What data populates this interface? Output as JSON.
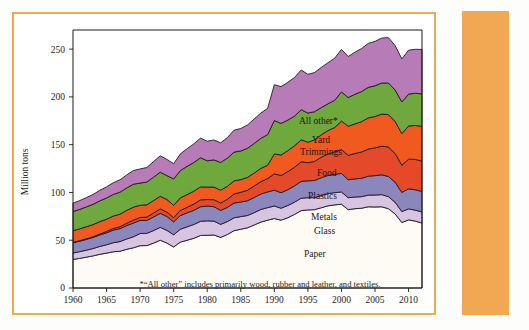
{
  "figure": {
    "frame_color": "#f0a94c",
    "side_bar_color": "#f2a852",
    "background_color": "#ffffff"
  },
  "footnote": {
    "text": "*“All other” includes primarily wood, rubber and leather, and textiles."
  },
  "series_labels": {
    "all_other": "All other*",
    "yard_trimmings_line1": "Yard",
    "yard_trimmings_line2": "Trimmings",
    "food": "Food",
    "plastics": "Plastics",
    "metals": "Metals",
    "glass": "Glass",
    "paper": "Paper"
  },
  "chart_data": {
    "type": "area",
    "title": "",
    "subtitle": "",
    "xlabel": "",
    "ylabel": "Million tons",
    "stacked": true,
    "grid": false,
    "legend_position": "inline-labels",
    "xlim": [
      1960,
      2012
    ],
    "ylim": [
      0,
      270
    ],
    "ytick_labels": [
      "0",
      "50",
      "100",
      "150",
      "200",
      "250"
    ],
    "yticks": [
      0,
      50,
      100,
      150,
      200,
      250
    ],
    "xtick_labels": [
      "1960",
      "1965",
      "1970",
      "1975",
      "1980",
      "1985",
      "1990",
      "1995",
      "2000",
      "2005",
      "2010"
    ],
    "xticks": [
      1960,
      1965,
      1970,
      1975,
      1980,
      1985,
      1990,
      1995,
      2000,
      2005,
      2010
    ],
    "x": [
      1960,
      1961,
      1962,
      1963,
      1964,
      1965,
      1966,
      1967,
      1968,
      1969,
      1970,
      1971,
      1972,
      1973,
      1974,
      1975,
      1976,
      1977,
      1978,
      1979,
      1980,
      1981,
      1982,
      1983,
      1984,
      1985,
      1986,
      1987,
      1988,
      1989,
      1990,
      1991,
      1992,
      1993,
      1994,
      1995,
      1996,
      1997,
      1998,
      1999,
      2000,
      2001,
      2002,
      2003,
      2004,
      2005,
      2006,
      2007,
      2008,
      2009,
      2010,
      2011,
      2012
    ],
    "annotation": "*“All other” includes primarily wood, rubber and leather, and textiles.",
    "series": [
      {
        "name": "Paper",
        "color": "#fdfbf4",
        "values": [
          29.9,
          31.0,
          32.3,
          33.6,
          35.3,
          36.5,
          37.9,
          38.5,
          40.5,
          42.1,
          44.3,
          44.4,
          47.0,
          50.0,
          47.0,
          43.0,
          48.0,
          50.0,
          52.0,
          55.0,
          55.2,
          55.5,
          53.0,
          56.0,
          60.0,
          61.5,
          63.0,
          66.0,
          69.0,
          71.0,
          72.7,
          71.0,
          73.5,
          77.0,
          81.0,
          81.7,
          82.0,
          84.0,
          86.0,
          87.0,
          87.7,
          82.0,
          83.0,
          83.5,
          85.0,
          84.8,
          85.0,
          83.0,
          77.5,
          68.5,
          71.3,
          70.0,
          68.0
        ]
      },
      {
        "name": "Glass",
        "color": "#d6c4e0",
        "values": [
          6.7,
          7.0,
          7.3,
          7.7,
          8.2,
          8.7,
          9.5,
          10.1,
          10.8,
          11.5,
          12.7,
          12.8,
          13.1,
          13.5,
          13.3,
          12.7,
          13.5,
          14.0,
          14.5,
          14.8,
          15.1,
          14.5,
          13.6,
          13.5,
          13.5,
          13.2,
          12.9,
          12.9,
          13.2,
          13.1,
          13.1,
          12.5,
          12.8,
          12.8,
          13.0,
          12.8,
          12.5,
          12.8,
          12.8,
          12.8,
          12.8,
          12.5,
          12.2,
          12.1,
          12.2,
          12.5,
          12.7,
          12.6,
          12.2,
          11.5,
          11.5,
          11.5,
          11.6
        ]
      },
      {
        "name": "Metals",
        "color": "#8b86bb",
        "values": [
          10.8,
          11.0,
          11.3,
          11.6,
          12.1,
          12.6,
          13.2,
          13.5,
          14.0,
          14.4,
          13.8,
          13.5,
          14.2,
          14.7,
          14.5,
          13.5,
          14.3,
          14.6,
          14.8,
          15.2,
          15.5,
          15.1,
          14.6,
          14.8,
          15.4,
          15.3,
          15.4,
          15.8,
          16.2,
          16.4,
          16.6,
          16.2,
          16.6,
          17.0,
          17.6,
          17.7,
          18.0,
          18.6,
          19.0,
          19.2,
          19.4,
          18.8,
          19.0,
          19.2,
          19.8,
          20.3,
          20.8,
          21.1,
          21.0,
          20.0,
          21.0,
          21.3,
          21.4
        ]
      },
      {
        "name": "Plastics",
        "color": "#e44a2a",
        "values": [
          0.4,
          0.5,
          0.6,
          0.7,
          0.9,
          1.4,
          1.7,
          2.0,
          2.5,
          3.0,
          3.0,
          3.5,
          4.2,
          4.6,
          4.5,
          4.4,
          5.4,
          5.8,
          6.5,
          7.2,
          6.8,
          7.3,
          7.8,
          8.5,
          9.5,
          10.2,
          11.0,
          12.0,
          13.0,
          14.0,
          17.1,
          18.0,
          18.8,
          19.5,
          20.5,
          18.9,
          20.0,
          21.5,
          22.5,
          23.5,
          25.0,
          25.5,
          26.5,
          27.5,
          28.5,
          29.0,
          30.0,
          30.8,
          30.0,
          28.5,
          31.0,
          31.8,
          31.8
        ]
      },
      {
        "name": "Food",
        "color": "#f05a1e",
        "values": [
          12.2,
          12.4,
          12.6,
          12.8,
          13.0,
          12.8,
          13.0,
          13.2,
          13.4,
          13.6,
          12.8,
          12.9,
          13.0,
          13.2,
          13.3,
          13.0,
          13.2,
          13.4,
          13.5,
          13.6,
          13.0,
          13.2,
          13.4,
          13.6,
          13.8,
          13.2,
          13.4,
          13.6,
          13.8,
          14.0,
          20.8,
          21.5,
          22.0,
          22.5,
          23.0,
          21.5,
          22.5,
          23.5,
          24.5,
          25.5,
          29.8,
          30.5,
          31.0,
          31.8,
          32.5,
          32.9,
          33.5,
          34.0,
          33.5,
          33.0,
          34.7,
          35.5,
          36.4
        ]
      },
      {
        "name": "Yard Trimmings",
        "color": "#6fa83c",
        "values": [
          20.0,
          20.4,
          20.8,
          21.2,
          21.7,
          22.2,
          22.6,
          23.0,
          23.5,
          24.0,
          23.2,
          23.8,
          24.5,
          25.2,
          25.0,
          27.5,
          28.5,
          29.5,
          30.0,
          30.5,
          27.5,
          28.5,
          29.0,
          29.5,
          30.0,
          30.0,
          30.5,
          31.0,
          31.5,
          32.0,
          35.0,
          33.0,
          32.0,
          31.0,
          31.5,
          30.5,
          29.5,
          28.5,
          28.0,
          28.5,
          30.5,
          30.0,
          31.0,
          31.5,
          32.0,
          32.1,
          32.5,
          33.0,
          33.0,
          33.2,
          33.4,
          33.7,
          34.0
        ]
      },
      {
        "name": "All other*",
        "color": "#b77bb8",
        "values": [
          8.8,
          9.2,
          9.7,
          10.3,
          11.0,
          11.6,
          12.3,
          12.9,
          13.6,
          14.3,
          14.8,
          15.2,
          16.3,
          17.2,
          17.0,
          16.0,
          17.5,
          18.5,
          19.5,
          20.5,
          20.5,
          20.8,
          20.5,
          21.5,
          23.0,
          23.5,
          24.5,
          25.5,
          26.5,
          27.5,
          37.5,
          38.5,
          39.5,
          40.5,
          41.5,
          40.5,
          41.0,
          42.0,
          43.0,
          44.0,
          44.5,
          43.0,
          44.0,
          45.0,
          46.0,
          46.5,
          47.0,
          47.5,
          46.5,
          45.0,
          46.0,
          46.0,
          46.5
        ]
      }
    ]
  }
}
